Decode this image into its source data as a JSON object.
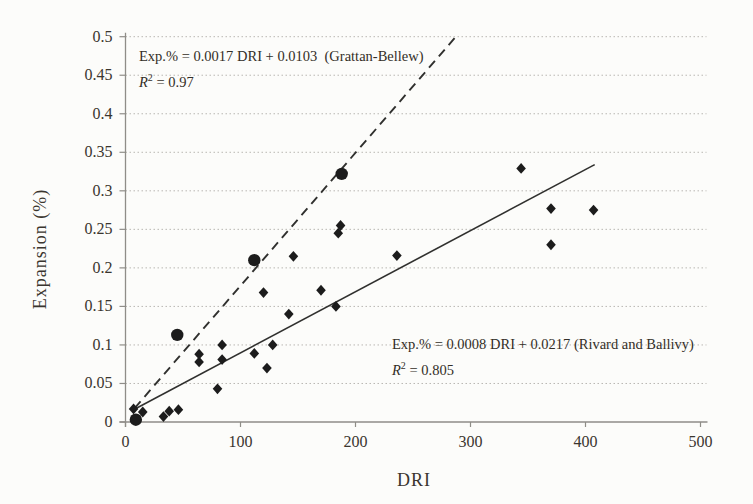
{
  "figure": {
    "background": "#fcfcfa",
    "text_color": "#3a352e",
    "axis_color": "#8f8d88",
    "grid_color": "#b9b7b2",
    "marker_color": "#1c1c1c",
    "line_color": "#30302e"
  },
  "chart_data": {
    "type": "scatter",
    "title": "",
    "xlabel": "DRI",
    "ylabel": "Expansion (%)",
    "xlim": [
      0,
      500
    ],
    "ylim": [
      0,
      0.5
    ],
    "xticks": [
      0,
      100,
      200,
      300,
      400,
      500
    ],
    "xtick_labels": [
      "0",
      "100",
      "200",
      "300",
      "400",
      "500"
    ],
    "yticks": [
      0,
      0.05,
      0.1,
      0.15,
      0.2,
      0.25,
      0.3,
      0.35,
      0.4,
      0.45,
      0.5
    ],
    "ytick_labels": [
      "0",
      "0.05",
      "0.1",
      "0.15",
      "0.2",
      "0.25",
      "0.3",
      "0.35",
      "0.4",
      "0.45",
      "0.5"
    ],
    "grid": "horizontal dotted lines at every 0.05",
    "legend": "none",
    "series": [
      {
        "name": "diamond-points",
        "marker": "diamond",
        "points": [
          [
            7,
            0.017
          ],
          [
            15,
            0.013
          ],
          [
            33,
            0.007
          ],
          [
            38,
            0.014
          ],
          [
            46,
            0.016
          ],
          [
            64,
            0.078
          ],
          [
            64,
            0.088
          ],
          [
            80,
            0.043
          ],
          [
            84,
            0.081
          ],
          [
            84,
            0.1
          ],
          [
            112,
            0.089
          ],
          [
            120,
            0.168
          ],
          [
            123,
            0.07
          ],
          [
            128,
            0.1
          ],
          [
            142,
            0.14
          ],
          [
            146,
            0.215
          ],
          [
            170,
            0.171
          ],
          [
            183,
            0.15
          ],
          [
            185,
            0.245
          ],
          [
            187,
            0.255
          ],
          [
            236,
            0.216
          ],
          [
            344,
            0.329
          ],
          [
            370,
            0.23
          ],
          [
            370,
            0.277
          ],
          [
            407,
            0.275
          ]
        ]
      },
      {
        "name": "circle-points",
        "marker": "circle",
        "points": [
          [
            9,
            0.003
          ],
          [
            45,
            0.113
          ],
          [
            112,
            0.21
          ],
          [
            188,
            0.322
          ]
        ]
      }
    ],
    "fit_lines": [
      {
        "name": "grattan-bellew-fit",
        "style": "dashed",
        "x1": 8,
        "y1": 0.018,
        "x2": 289,
        "y2": 0.503
      },
      {
        "name": "rivard-ballivy-fit",
        "style": "solid",
        "x1": 7,
        "y1": 0.016,
        "x2": 408,
        "y2": 0.334
      }
    ],
    "annotations": [
      {
        "name": "grattan-bellew-equation",
        "equation": "Exp.% = 0.0017 DRI + 0.0103  (Grattan-Bellew)",
        "r_var": "R",
        "r_sup": "2",
        "r_rest": " = 0.97"
      },
      {
        "name": "rivard-ballivy-equation",
        "equation": "Exp.% = 0.0008 DRI + 0.0217 (Rivard and Ballivy)",
        "r_var": "R",
        "r_sup": "2",
        "r_rest": " = 0.805"
      }
    ]
  }
}
